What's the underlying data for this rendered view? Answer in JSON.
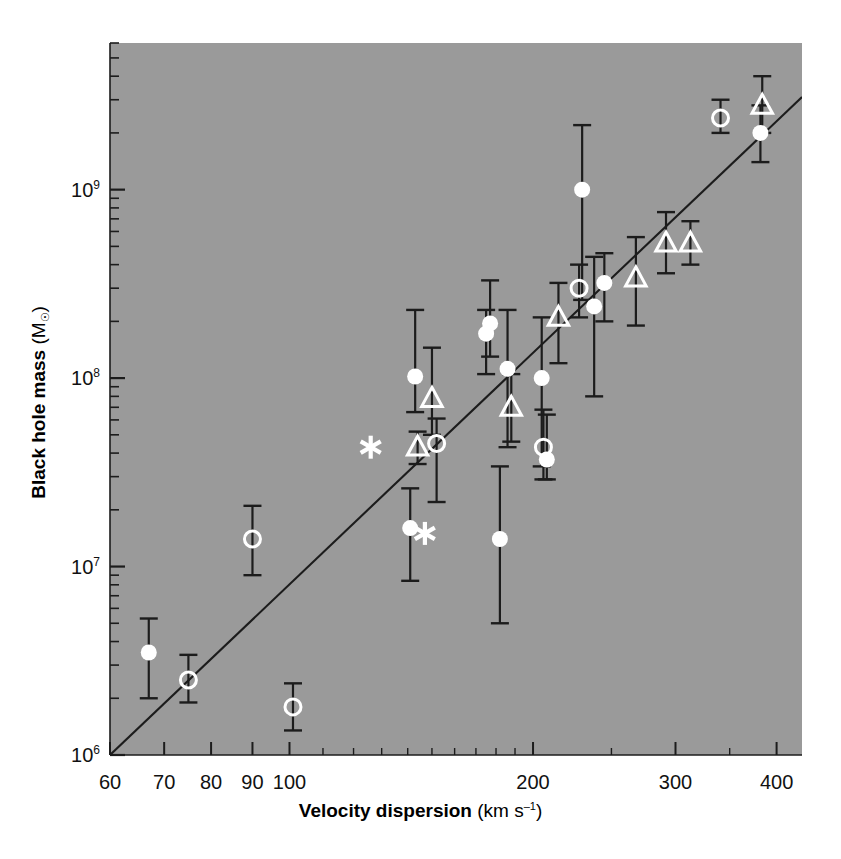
{
  "chart_data": {
    "type": "scatter",
    "title": "",
    "xlabel": "Velocity dispersion (km s⁻¹)",
    "xlabel_bold": "Velocity dispersion",
    "xlabel_unit": "(km s",
    "xlabel_unit_exp": "–1",
    "xlabel_unit_close": ")",
    "ylabel": "Black hole mass (M☉)",
    "ylabel_bold": "Black hole mass",
    "ylabel_unit_open": "(M",
    "ylabel_unit_sub": "☉",
    "ylabel_unit_close": ")",
    "xscale": "log",
    "yscale": "log",
    "xlim": [
      60,
      430
    ],
    "ylim": [
      1000000,
      6000000000
    ],
    "grid": false,
    "legend": "none",
    "background_color": "#9a9a9a",
    "marker_color": "#ffffff",
    "errorbar_color": "#1c1c1c",
    "fitline_color": "#1c1c1c",
    "xticks": [
      {
        "value": 60,
        "label": "60"
      },
      {
        "value": 70,
        "label": "70"
      },
      {
        "value": 80,
        "label": "80"
      },
      {
        "value": 90,
        "label": "90"
      },
      {
        "value": 100,
        "label": "100"
      },
      {
        "value": 200,
        "label": "200"
      },
      {
        "value": 300,
        "label": "300"
      },
      {
        "value": 400,
        "label": "400"
      }
    ],
    "yticks": [
      {
        "value": 1000000,
        "mantissa": "10",
        "exponent": "6"
      },
      {
        "value": 10000000,
        "mantissa": "10",
        "exponent": "7"
      },
      {
        "value": 100000000,
        "mantissa": "10",
        "exponent": "8"
      },
      {
        "value": 1000000000,
        "mantissa": "10",
        "exponent": "9"
      }
    ],
    "fit_line": {
      "x_start": 60.0,
      "y_start": 1000000,
      "x_end": 430.0,
      "y_end": 3100000000,
      "slope_log": 4.0
    },
    "series": [
      {
        "name": "filled-circle",
        "marker": "filled-circle",
        "points": [
          {
            "x": 67,
            "y": 3500000.0,
            "ylo": 2000000.0,
            "yhi": 5300000.0
          },
          {
            "x": 141,
            "y": 16000000.0,
            "ylo": 8400000.0,
            "yhi": 26000000.0
          },
          {
            "x": 143,
            "y": 102000000.0,
            "ylo": 66000000.0,
            "yhi": 230000000.0
          },
          {
            "x": 175,
            "y": 172000000.0,
            "ylo": 105000000.0,
            "yhi": 230000000.0
          },
          {
            "x": 177,
            "y": 195000000.0,
            "ylo": 130000000.0,
            "yhi": 330000000.0
          },
          {
            "x": 182,
            "y": 14000000.0,
            "ylo": 5000000.0,
            "yhi": 34000000.0
          },
          {
            "x": 186,
            "y": 112000000.0,
            "ylo": 43000000.0,
            "yhi": 230000000.0
          },
          {
            "x": 205,
            "y": 100000000.0,
            "ylo": 34000000.0,
            "yhi": 210000000.0
          },
          {
            "x": 208,
            "y": 37000000.0,
            "ylo": 29000000.0,
            "yhi": 64000000.0
          },
          {
            "x": 230,
            "y": 1000000000.0,
            "ylo": 260000000.0,
            "yhi": 2200000000.0
          },
          {
            "x": 238,
            "y": 240000000.0,
            "ylo": 80000000.0,
            "yhi": 440000000.0
          },
          {
            "x": 245,
            "y": 320000000.0,
            "ylo": 200000000.0,
            "yhi": 460000000.0
          },
          {
            "x": 382,
            "y": 2000000000.0,
            "ylo": 1400000000.0,
            "yhi": 2800000000.0
          }
        ]
      },
      {
        "name": "open-circle",
        "marker": "open-circle",
        "points": [
          {
            "x": 75,
            "y": 2500000.0,
            "ylo": 1900000.0,
            "yhi": 3400000.0
          },
          {
            "x": 90,
            "y": 14000000.0,
            "ylo": 9000000.0,
            "yhi": 21000000.0
          },
          {
            "x": 101,
            "y": 1800000.0,
            "ylo": 1350000.0,
            "yhi": 2400000.0
          },
          {
            "x": 152,
            "y": 45000000.0,
            "ylo": 22000000.0,
            "yhi": 61000000.0
          },
          {
            "x": 206,
            "y": 43000000.0,
            "ylo": 29000000.0,
            "yhi": 68000000.0
          },
          {
            "x": 228,
            "y": 300000000.0,
            "ylo": 210000000.0,
            "yhi": 400000000.0
          },
          {
            "x": 341,
            "y": 2400000000.0,
            "ylo": 2000000000.0,
            "yhi": 3000000000.0
          }
        ]
      },
      {
        "name": "triangle",
        "marker": "open-triangle",
        "points": [
          {
            "x": 144,
            "y": 43000000.0,
            "ylo": 35000000.0,
            "yhi": 52000000.0
          },
          {
            "x": 150,
            "y": 78000000.0,
            "ylo": 50000000.0,
            "yhi": 145000000.0
          },
          {
            "x": 188,
            "y": 70000000.0,
            "ylo": 46000000.0,
            "yhi": 105000000.0
          },
          {
            "x": 215,
            "y": 210000000.0,
            "ylo": 120000000.0,
            "yhi": 320000000.0
          },
          {
            "x": 268,
            "y": 340000000.0,
            "ylo": 190000000.0,
            "yhi": 560000000.0
          },
          {
            "x": 292,
            "y": 520000000.0,
            "ylo": 360000000.0,
            "yhi": 760000000.0
          },
          {
            "x": 313,
            "y": 520000000.0,
            "ylo": 400000000.0,
            "yhi": 680000000.0
          },
          {
            "x": 384,
            "y": 2800000000.0,
            "ylo": 2000000000.0,
            "yhi": 4000000000.0
          }
        ]
      },
      {
        "name": "asterisk",
        "marker": "asterisk",
        "points": [
          {
            "x": 126,
            "y": 43000000.0
          },
          {
            "x": 147,
            "y": 15000000.0
          }
        ]
      }
    ]
  }
}
